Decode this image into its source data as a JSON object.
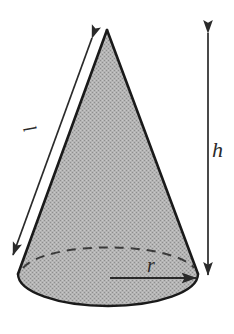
{
  "figure": {
    "name": "cone-diagram",
    "background_color": "#ffffff",
    "outline_color": "#1a1a1a",
    "fill_color": "#a9a9a9",
    "arrow_color": "#2a2a2a",
    "labels": {
      "slant": "l",
      "height": "h",
      "radius": "r"
    },
    "geometry": {
      "apex": {
        "x": 107,
        "y": 30
      },
      "base_center": {
        "x": 108,
        "y": 277
      },
      "base_radius_x": 90,
      "base_radius_y": 32,
      "base_left": {
        "x": 18,
        "y": 274
      },
      "base_right": {
        "x": 198,
        "y": 274
      }
    },
    "annotations": [
      {
        "name": "slant-arrow",
        "type": "double-headed-arrow",
        "label": "l",
        "from": {
          "x": 92,
          "y": 37
        },
        "to": {
          "x": 12,
          "y": 256
        }
      },
      {
        "name": "height-arrow",
        "type": "double-headed-arrow",
        "label": "h",
        "from": {
          "x": 208,
          "y": 32
        },
        "to": {
          "x": 208,
          "y": 276
        }
      },
      {
        "name": "radius-arrow",
        "type": "single-headed-arrow",
        "label": "r",
        "from": {
          "x": 110,
          "y": 278
        },
        "to": {
          "x": 197,
          "y": 278
        }
      },
      {
        "name": "base-hidden-arc",
        "type": "dashed-arc",
        "label": ""
      }
    ]
  }
}
